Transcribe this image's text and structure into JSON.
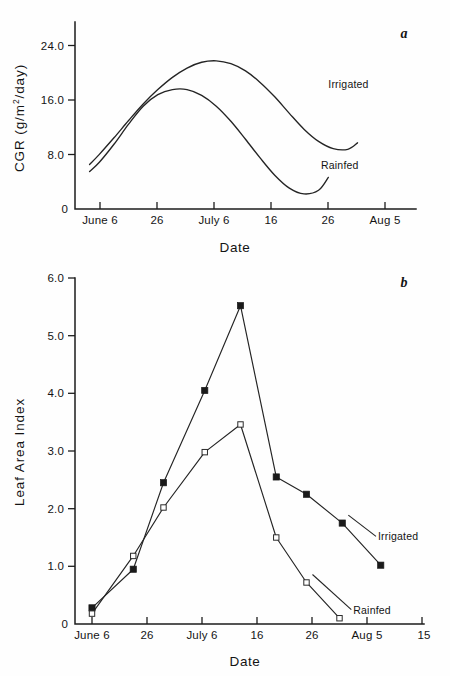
{
  "figure": {
    "caption_tags": [
      "a",
      "b"
    ],
    "background": "#ffffff",
    "ink": "#1a1a1a"
  },
  "chart_data": [
    {
      "id": "panel-a",
      "type": "line",
      "panel_label": "a",
      "title": "",
      "xlabel": "Date",
      "ylabel": "CGR (g/m2/day)",
      "ylabel_display": "CGR (g/m",
      "ylabel_sup": "2",
      "ylabel_tail": "/day)",
      "ylim": [
        0,
        26
      ],
      "yticks": [
        0,
        8.0,
        16.0,
        24.0
      ],
      "ytick_labels": [
        "0",
        "8.0",
        "16.0",
        "24.0"
      ],
      "xlim": [
        0,
        70
      ],
      "xticks": [
        0,
        10,
        20,
        30,
        40,
        50
      ],
      "xtick_labels": [
        "June 6",
        "26",
        "July 6",
        "16",
        "26",
        "Aug 5"
      ],
      "grid": false,
      "legend_position": "inline-right",
      "series": [
        {
          "name": "Irrigated",
          "style": "smooth-curve",
          "marker": "none",
          "label_anchor": {
            "x": 52.0,
            "y": 16.8
          },
          "x": [
            3.0,
            5.0,
            8.0,
            11.0,
            14.0,
            17.0,
            20.0,
            23.0,
            26.0,
            29.0,
            32.0,
            35.0,
            38.0,
            41.0,
            44.0,
            47.0,
            50.0,
            53.0,
            56.0,
            58.0
          ],
          "y": [
            6.2,
            7.6,
            9.9,
            12.3,
            14.6,
            16.6,
            18.3,
            19.6,
            20.4,
            20.6,
            20.2,
            19.2,
            17.6,
            15.6,
            13.3,
            11.1,
            9.4,
            8.4,
            8.3,
            9.2
          ]
        },
        {
          "name": "Rainfed",
          "style": "smooth-curve",
          "marker": "none",
          "label_anchor": {
            "x": 50.5,
            "y": 5.6
          },
          "x": [
            3.0,
            5.0,
            8.0,
            11.0,
            14.0,
            17.0,
            20.0,
            23.0,
            26.0,
            29.0,
            32.0,
            35.0,
            38.0,
            41.0,
            44.0,
            47.0,
            50.0,
            52.0
          ],
          "y": [
            5.2,
            6.5,
            9.0,
            11.8,
            14.3,
            15.9,
            16.6,
            16.6,
            15.8,
            14.3,
            12.2,
            9.7,
            7.1,
            4.7,
            2.9,
            2.1,
            2.6,
            4.4
          ]
        }
      ]
    },
    {
      "id": "panel-b",
      "type": "line",
      "panel_label": "b",
      "title": "",
      "xlabel": "Date",
      "ylabel": "Leaf Area Index",
      "ylim": [
        0,
        6.0
      ],
      "yticks": [
        0,
        1.0,
        2.0,
        3.0,
        4.0,
        5.0,
        6.0
      ],
      "ytick_labels": [
        "0",
        "1.0",
        "2.0",
        "3.0",
        "4.0",
        "5.0",
        "6.0"
      ],
      "xlim": [
        0,
        60
      ],
      "xticks": [
        0,
        10,
        20,
        30,
        40,
        50,
        60
      ],
      "xtick_labels": [
        "June 6",
        "26",
        "July 6",
        "16",
        "26",
        "Aug 5",
        "15"
      ],
      "grid": false,
      "legend_position": "inline-right",
      "series": [
        {
          "name": "Irrigated",
          "marker": "filled-square",
          "label_anchor": {
            "x": 52.0,
            "y": 1.45
          },
          "x": [
            0.0,
            7.5,
            13.0,
            20.5,
            27.0,
            33.5,
            39.0,
            45.5,
            52.5
          ],
          "y": [
            0.28,
            0.95,
            2.45,
            4.05,
            5.52,
            2.55,
            2.25,
            1.75,
            1.02
          ]
        },
        {
          "name": "Rainfed",
          "marker": "open-square",
          "label_anchor": {
            "x": 47.5,
            "y": 0.18
          },
          "x": [
            0.0,
            7.5,
            13.0,
            20.5,
            27.0,
            33.5,
            39.0,
            45.0
          ],
          "y": [
            0.18,
            1.18,
            2.02,
            2.98,
            3.46,
            1.5,
            0.72,
            0.1
          ]
        }
      ]
    }
  ]
}
